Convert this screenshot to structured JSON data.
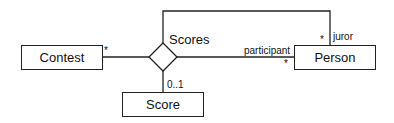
{
  "diagram": {
    "type": "UML class diagram (n-ary association)",
    "classes": [
      {
        "id": "contest",
        "name": "Contest"
      },
      {
        "id": "person",
        "name": "Person"
      },
      {
        "id": "score",
        "name": "Score"
      }
    ],
    "association": {
      "name": "Scores",
      "shape": "diamond",
      "ends": [
        {
          "class": "Contest",
          "role": "",
          "multiplicity": "*"
        },
        {
          "class": "Person",
          "role": "participant",
          "multiplicity": "*"
        },
        {
          "class": "Person",
          "role": "juror",
          "multiplicity": "*"
        },
        {
          "class": "Score",
          "role": "",
          "multiplicity": "0..1"
        }
      ]
    }
  }
}
